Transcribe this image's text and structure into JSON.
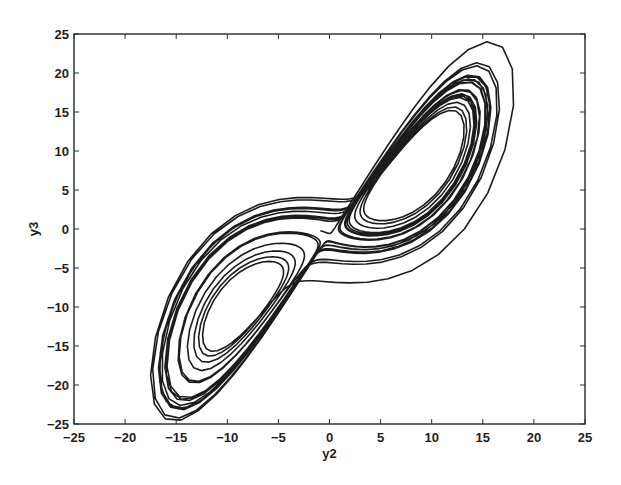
{
  "chart_data": {
    "type": "line",
    "title": "",
    "xlabel": "y2",
    "ylabel": "y3",
    "xlim": [
      -25,
      25
    ],
    "ylim": [
      -25,
      25
    ],
    "xticks": [
      -25,
      -20,
      -15,
      -10,
      -5,
      0,
      5,
      10,
      15,
      20,
      25
    ],
    "yticks": [
      -25,
      -20,
      -15,
      -10,
      -5,
      0,
      5,
      10,
      15,
      20,
      25
    ],
    "xtick_labels": [
      "−25",
      "−20",
      "−15",
      "−10",
      "−5",
      "0",
      "5",
      "10",
      "15",
      "20",
      "25"
    ],
    "ytick_labels": [
      "−25",
      "−20",
      "−15",
      "−10",
      "−5",
      "0",
      "5",
      "10",
      "15",
      "20",
      "25"
    ],
    "grid": false,
    "legend": null,
    "series": [
      {
        "name": "trajectory",
        "description": "Lorenz-type chaotic attractor phase portrait (y2 vs y3), two-lobed butterfly; lobes centered near (-8.5,-8.5) and (8.5,8.5)",
        "generator": {
          "system": "lorenz",
          "sigma": 10,
          "rho": 28,
          "beta": 2.6667,
          "initial": [
            1.0,
            1.0,
            20.0
          ],
          "dt": 0.01,
          "steps": 2600,
          "transient": 150,
          "x_component": 0,
          "y_component": 1
        },
        "extent": {
          "x": [
            -17.5,
            18
          ],
          "y": [
            -24.5,
            24
          ]
        },
        "color": "#1c1c1c"
      }
    ]
  },
  "axes": {
    "frame_px": {
      "left": 74,
      "top": 34,
      "right": 585,
      "bottom": 424
    }
  }
}
